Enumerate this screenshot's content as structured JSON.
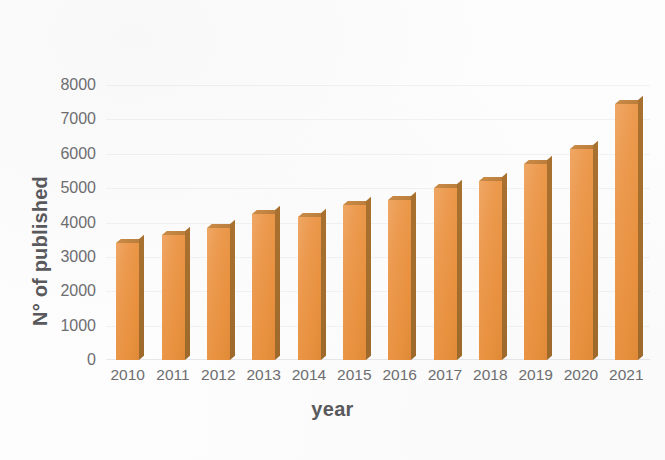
{
  "chart_data": {
    "type": "bar",
    "title": "",
    "subtitle": "",
    "xlabel": "year",
    "ylabel": "N° of published",
    "categories": [
      "2010",
      "2011",
      "2012",
      "2013",
      "2014",
      "2015",
      "2016",
      "2017",
      "2018",
      "2019",
      "2020",
      "2021"
    ],
    "values": [
      3400,
      3650,
      3850,
      4250,
      4150,
      4500,
      4650,
      5000,
      5200,
      5700,
      6150,
      7450
    ],
    "series": [
      {
        "name": "N° of published",
        "values": [
          3400,
          3650,
          3850,
          4250,
          4150,
          4500,
          4650,
          5000,
          5200,
          5700,
          6150,
          7450
        ]
      }
    ],
    "ylim": [
      0,
      8000
    ],
    "ytick_labels": [
      "8000",
      "7000",
      "6000",
      "5000",
      "4000",
      "3000",
      "2000",
      "1000",
      "0"
    ],
    "ytick_values": [
      8000,
      7000,
      6000,
      5000,
      4000,
      3000,
      2000,
      1000,
      0
    ],
    "ytick_step": 1000,
    "grid": true,
    "grid_axis": "y",
    "legend": false,
    "legend_position": "none",
    "bar_color": "#e8914a",
    "bar_shade_color": "#a06d2f",
    "bar_style": "3d",
    "background_color": "#fdfdfd",
    "axis_text_color": "#6d6d70",
    "axis_title_color": "#59595c"
  }
}
